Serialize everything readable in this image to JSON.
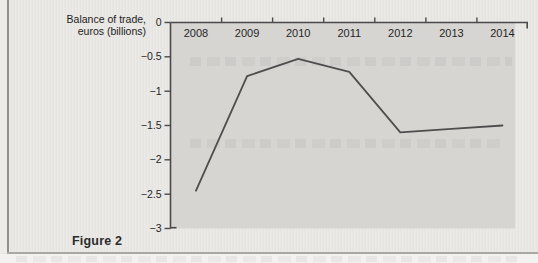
{
  "figure": {
    "y_axis_title_line1": "Balance of trade,",
    "y_axis_title_line2": "euros (billions)",
    "caption": "Figure 2"
  },
  "chart_data": {
    "type": "line",
    "title": "",
    "xlabel": "",
    "ylabel": "Balance of trade, euros (billions)",
    "categories": [
      "2008",
      "2009",
      "2010",
      "2011",
      "2012",
      "2013",
      "2014"
    ],
    "values": [
      -2.45,
      -0.78,
      -0.53,
      -0.72,
      -1.6,
      -1.55,
      -1.5
    ],
    "ylim": [
      -3,
      0
    ],
    "y_ticks": [
      0,
      -0.5,
      -1,
      -1.5,
      -2,
      -2.5,
      -3
    ],
    "y_tick_labels": [
      "0",
      "−0.5",
      "−1",
      "−1.5",
      "−2",
      "−2.5",
      "−3"
    ],
    "x_axis_position": "top",
    "grid": false,
    "legend": "none",
    "line_color": "#4e4e4e",
    "axis_color": "#4a4a4a",
    "plot_bg": "#d6d5d2"
  }
}
